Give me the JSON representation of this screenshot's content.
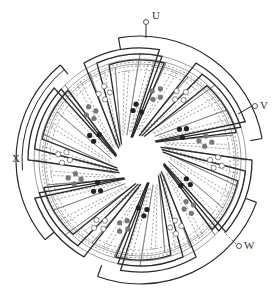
{
  "diagram": {
    "type": "stator-winding-diagram",
    "center": [
      140,
      160
    ],
    "rotor_radius": 22,
    "phases": 3,
    "coil_groups": 6,
    "colors": {
      "line": "#2a2a2a",
      "dashed": "#555555",
      "thin": "#777777",
      "dot_filled": "#222222",
      "dot_gray": "#777777",
      "dot_open": "#ffffff"
    },
    "terminals": [
      {
        "label": "U",
        "x": 146,
        "y": 22,
        "lx": 153,
        "ly": 16
      },
      {
        "label": "V",
        "x": 255,
        "y": 106,
        "lx": 262,
        "ly": 100
      },
      {
        "label": "W",
        "x": 239,
        "y": 246,
        "lx": 246,
        "ly": 240
      },
      {
        "label": "X",
        "x": 0,
        "y": 0,
        "lx": 12,
        "ly": 153
      }
    ]
  }
}
